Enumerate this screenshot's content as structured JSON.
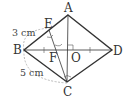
{
  "diagram": {
    "type": "rhombus-geometry",
    "points": {
      "A": {
        "label": "A",
        "x": 68,
        "y": 15
      },
      "B": {
        "label": "B",
        "x": 24,
        "y": 50
      },
      "C": {
        "label": "C",
        "x": 67,
        "y": 82
      },
      "D": {
        "label": "D",
        "x": 112,
        "y": 50
      },
      "O": {
        "label": "O"
      },
      "E": {
        "label": "E"
      },
      "F": {
        "label": "F"
      }
    },
    "measurements": {
      "BE": "3 cm",
      "BC": "5 cm"
    },
    "colors": {
      "line": "#333333",
      "dashed": "#aaaaaa"
    }
  }
}
